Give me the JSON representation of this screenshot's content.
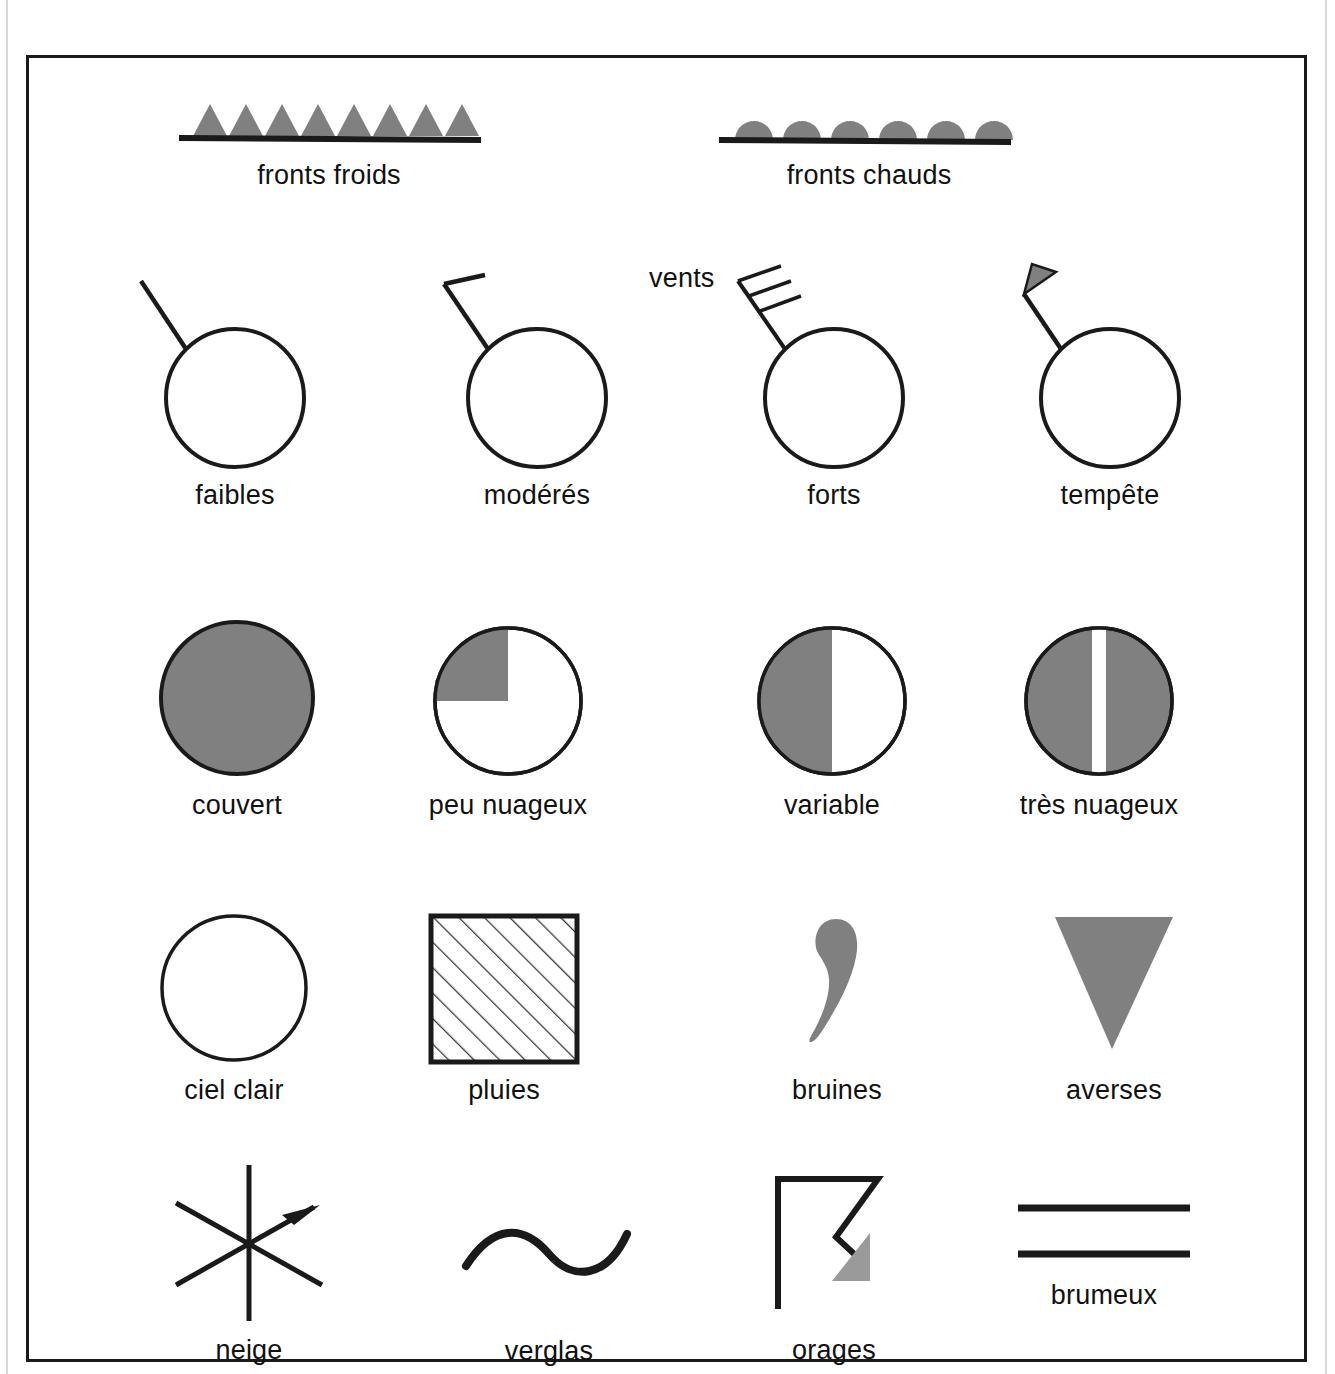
{
  "diagram": {
    "language": "fr",
    "colors": {
      "ink": "#1a1a1a",
      "fill_gray": "#808080",
      "paper": "#ffffff"
    },
    "groups": [
      {
        "name": "fronts",
        "items": [
          {
            "id": "fronts-froids",
            "label": "fronts froids",
            "symbol": "cold-front-icon",
            "teeth": 8,
            "tooth_shape": "triangle"
          },
          {
            "id": "fronts-chauds",
            "label": "fronts chauds",
            "symbol": "warm-front-icon",
            "teeth": 6,
            "tooth_shape": "semicircle"
          }
        ]
      },
      {
        "name": "vents",
        "group_label": "vents",
        "items": [
          {
            "id": "vents-faibles",
            "label": "faibles",
            "symbol": "wind-light-icon",
            "barbs": 0
          },
          {
            "id": "vents-moderes",
            "label": "modérés",
            "symbol": "wind-moderate-icon",
            "barbs": 1
          },
          {
            "id": "vents-forts",
            "label": "forts",
            "symbol": "wind-strong-icon",
            "barbs": 3
          },
          {
            "id": "vents-tempete",
            "label": "tempête",
            "symbol": "wind-storm-icon",
            "barbs": 0,
            "pennant": 1
          }
        ]
      },
      {
        "name": "nebulosite",
        "items": [
          {
            "id": "couvert",
            "label": "couvert",
            "symbol": "sky-overcast-icon",
            "fill": "full"
          },
          {
            "id": "peu-nuageux",
            "label": "peu nuageux",
            "symbol": "sky-few-clouds-icon",
            "fill": "quarter"
          },
          {
            "id": "variable",
            "label": "variable",
            "symbol": "sky-variable-icon",
            "fill": "half"
          },
          {
            "id": "tres-nuageux",
            "label": "très nuageux",
            "symbol": "sky-mostly-cloudy-icon",
            "fill": "broken"
          }
        ]
      },
      {
        "name": "precipitations",
        "items": [
          {
            "id": "ciel-clair",
            "label": "ciel clair",
            "symbol": "sky-clear-icon",
            "fill": "none"
          },
          {
            "id": "pluies",
            "label": "pluies",
            "symbol": "rain-icon",
            "fill": "hatched-square"
          },
          {
            "id": "bruines",
            "label": "bruines",
            "symbol": "drizzle-icon",
            "fill": "comma"
          },
          {
            "id": "averses",
            "label": "averses",
            "symbol": "showers-icon",
            "fill": "down-triangle"
          }
        ]
      },
      {
        "name": "phenomenes",
        "items": [
          {
            "id": "neige",
            "label": "neige",
            "symbol": "snow-icon"
          },
          {
            "id": "verglas",
            "label": "verglas",
            "symbol": "freezing-rain-icon"
          },
          {
            "id": "orages",
            "label": "orages",
            "symbol": "thunderstorm-icon"
          },
          {
            "id": "brumeux",
            "label": "brumeux",
            "symbol": "mist-icon",
            "lines": 2
          }
        ]
      }
    ]
  }
}
